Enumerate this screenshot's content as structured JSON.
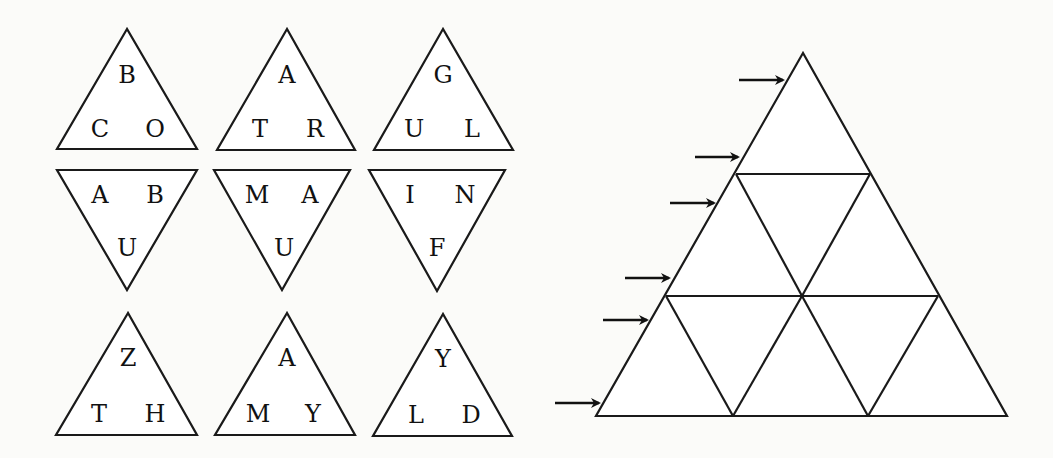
{
  "pieces": [
    {
      "id": "p1",
      "orientation": "up",
      "letters": {
        "top": "B",
        "left": "C",
        "right": "O"
      }
    },
    {
      "id": "p2",
      "orientation": "up",
      "letters": {
        "top": "A",
        "left": "T",
        "right": "R"
      }
    },
    {
      "id": "p3",
      "orientation": "up",
      "letters": {
        "top": "G",
        "left": "U",
        "right": "L"
      }
    },
    {
      "id": "p4",
      "orientation": "down",
      "letters": {
        "left": "A",
        "right": "B",
        "bottom": "U"
      }
    },
    {
      "id": "p5",
      "orientation": "down",
      "letters": {
        "left": "M",
        "right": "A",
        "bottom": "U"
      }
    },
    {
      "id": "p6",
      "orientation": "down",
      "letters": {
        "left": "I",
        "right": "N",
        "bottom": "F"
      }
    },
    {
      "id": "p7",
      "orientation": "up",
      "letters": {
        "top": "Z",
        "left": "T",
        "right": "H"
      }
    },
    {
      "id": "p8",
      "orientation": "up",
      "letters": {
        "top": "A",
        "left": "M",
        "right": "Y"
      }
    },
    {
      "id": "p9",
      "orientation": "up",
      "letters": {
        "top": "Y",
        "left": "L",
        "right": "D"
      }
    }
  ],
  "board": {
    "rows": 3,
    "cells": 9,
    "arrow_count": 6
  },
  "colors": {
    "stroke": "#1a1a1a",
    "background": "#fbfbf9"
  }
}
